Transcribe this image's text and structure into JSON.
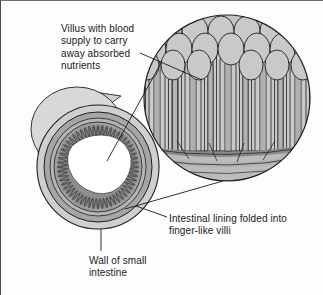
{
  "figure": {
    "background_color": "#fdfdfd",
    "line_color": "#1a1a1a"
  },
  "labels": {
    "villus": {
      "name": "villus-blood-supply-label",
      "lines": [
        "Villus with blood",
        "supply to carry",
        "away absorbed",
        "nutrients"
      ],
      "text": "Villus with blood\nsupply to carry\naway absorbed\nnutrients"
    },
    "lining": {
      "name": "intestinal-lining-label",
      "lines": [
        "Intestinal lining folded into",
        "finger-like villi"
      ],
      "text": "Intestinal lining folded into\nfinger-like villi"
    },
    "wall": {
      "name": "wall-of-small-intestine-label",
      "lines": [
        "Wall of small",
        "intestine"
      ],
      "text": "Wall of small\nintestine"
    }
  },
  "palette": {
    "outer_wall": "#cfcfcf",
    "wall_ring": "#a9a9a9",
    "submucosa": "#bdbdbd",
    "villi_layer": "#9a9a9a",
    "lumen": "#ffffff",
    "magnifier_fill": "#c4c4c4",
    "villus_body": "#c9c9c9",
    "villus_core": "#b0b0b0",
    "blood_vessel": "#8d8d8d",
    "outline": "#1f1f1f"
  },
  "structures": {
    "cross_section": {
      "name": "intestine-cross-section",
      "parts": [
        "outer wall",
        "muscle ring",
        "submucosa",
        "villi fringe",
        "lumen"
      ],
      "villi_teeth": 56
    },
    "magnified_view": {
      "name": "magnified-villi-circle",
      "villi_count": 5,
      "features": [
        "finger-like villi",
        "epithelial layer",
        "capillary loops",
        "blood vessels at base"
      ]
    },
    "leader_lines": {
      "name": "leader-lines",
      "count": 4
    }
  }
}
